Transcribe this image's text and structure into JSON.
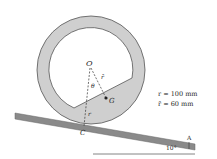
{
  "diagram": {
    "labels": {
      "O": "O",
      "G": "G",
      "C": "C",
      "A": "A",
      "theta": "θ",
      "r_bar": "r̄",
      "r": "r",
      "angle": "10°"
    },
    "given": {
      "r": "r = 100 mm",
      "r_bar": "r̄ = 60 mm"
    },
    "colors": {
      "ring_fill": "#cfcfcf",
      "ring_stroke": "#555555",
      "incline_fill": "#8a8a8a",
      "segment_fill": "#cfcfcf"
    }
  }
}
